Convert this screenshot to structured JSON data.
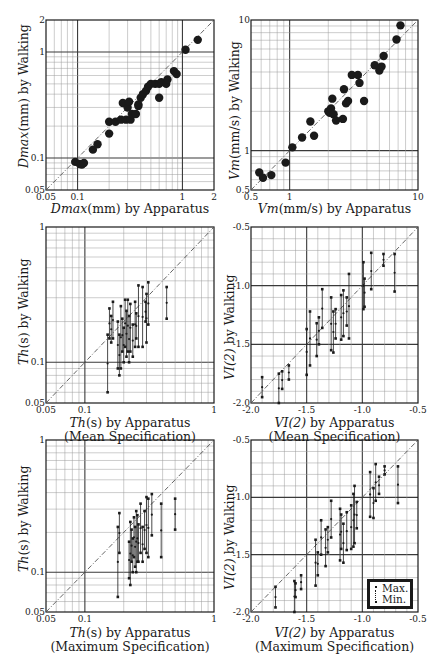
{
  "chart_data": [
    {
      "id": "p1",
      "type": "scatter",
      "scale": "log",
      "box": [
        46,
        20,
        214,
        190
      ],
      "xlim": [
        0.05,
        2
      ],
      "ylim": [
        0.05,
        2
      ],
      "xticks": [
        0.05,
        0.1,
        1,
        2
      ],
      "xtick_labels": [
        "0.05",
        "0.1",
        "1",
        "2"
      ],
      "yticks": [
        0.05,
        0.1,
        1,
        2
      ],
      "ytick_labels": [
        "0.05",
        "0.1",
        "1",
        "2"
      ],
      "major_grid": [
        0.1,
        1
      ],
      "xlabel_var": "Dmax",
      "xlabel_rest": "(mm) by Apparatus",
      "xlabel_sub": "",
      "ylabel_var": "Dmax",
      "ylabel_rest": "(mm) by Walking",
      "diagonal": true,
      "marker": "filled-circle",
      "points": [
        [
          0.095,
          0.092
        ],
        [
          0.105,
          0.088
        ],
        [
          0.11,
          0.087
        ],
        [
          0.115,
          0.09
        ],
        [
          0.14,
          0.12
        ],
        [
          0.155,
          0.135
        ],
        [
          0.2,
          0.17
        ],
        [
          0.2,
          0.22
        ],
        [
          0.23,
          0.22
        ],
        [
          0.26,
          0.23
        ],
        [
          0.27,
          0.33
        ],
        [
          0.29,
          0.23
        ],
        [
          0.3,
          0.3
        ],
        [
          0.31,
          0.34
        ],
        [
          0.32,
          0.23
        ],
        [
          0.33,
          0.26
        ],
        [
          0.36,
          0.26
        ],
        [
          0.38,
          0.31
        ],
        [
          0.38,
          0.32
        ],
        [
          0.4,
          0.37
        ],
        [
          0.42,
          0.4
        ],
        [
          0.45,
          0.43
        ],
        [
          0.47,
          0.47
        ],
        [
          0.5,
          0.5
        ],
        [
          0.55,
          0.5
        ],
        [
          0.6,
          0.37
        ],
        [
          0.6,
          0.5
        ],
        [
          0.63,
          0.52
        ],
        [
          0.7,
          0.5
        ],
        [
          0.72,
          0.55
        ],
        [
          0.83,
          0.66
        ],
        [
          0.88,
          0.62
        ],
        [
          1.07,
          1.05
        ],
        [
          1.4,
          1.3
        ]
      ]
    },
    {
      "id": "p2",
      "type": "scatter",
      "scale": "log",
      "box": [
        251,
        20,
        418,
        190
      ],
      "xlim": [
        0.5,
        10
      ],
      "ylim": [
        0.5,
        10
      ],
      "xticks": [
        0.5,
        1,
        10
      ],
      "xtick_labels": [
        "0.5",
        "1",
        "10"
      ],
      "yticks": [
        0.5,
        1,
        10
      ],
      "ytick_labels": [
        "0.5",
        "1",
        "10"
      ],
      "major_grid": [
        1
      ],
      "xlabel_var": "Vm",
      "xlabel_rest": "(mm/s) by Apparatus",
      "xlabel_sub": "",
      "ylabel_var": "Vm",
      "ylabel_rest": "(mm/s) by Walking",
      "diagonal": true,
      "marker": "filled-circle",
      "points": [
        [
          0.58,
          0.68
        ],
        [
          0.62,
          0.62
        ],
        [
          0.72,
          0.65
        ],
        [
          0.93,
          0.81
        ],
        [
          1.05,
          1.06
        ],
        [
          1.25,
          1.26
        ],
        [
          1.45,
          1.67
        ],
        [
          1.55,
          1.3
        ],
        [
          2.0,
          2.0
        ],
        [
          2.05,
          1.95
        ],
        [
          2.1,
          2.1
        ],
        [
          2.15,
          2.5
        ],
        [
          2.2,
          1.9
        ],
        [
          2.3,
          1.7
        ],
        [
          2.6,
          1.75
        ],
        [
          2.65,
          2.95
        ],
        [
          2.75,
          2.3
        ],
        [
          2.85,
          2.4
        ],
        [
          3.05,
          3.8
        ],
        [
          3.4,
          3.8
        ],
        [
          3.5,
          3.3
        ],
        [
          3.8,
          2.4
        ],
        [
          4.6,
          4.5
        ],
        [
          5.0,
          4.1
        ],
        [
          5.2,
          4.4
        ],
        [
          5.4,
          5.3
        ],
        [
          6.8,
          7.1
        ],
        [
          7.3,
          9.1
        ]
      ]
    },
    {
      "id": "p3",
      "type": "range",
      "scale": "log",
      "box": [
        46,
        227,
        214,
        403
      ],
      "xlim": [
        0.05,
        1
      ],
      "ylim": [
        0.05,
        1
      ],
      "xticks": [
        0.05,
        0.1,
        1
      ],
      "xtick_labels": [
        "0.05",
        "0.1",
        "1"
      ],
      "yticks": [
        0.05,
        0.1,
        1
      ],
      "ytick_labels": [
        "0.05",
        "0.1",
        "1"
      ],
      "major_grid": [
        0.1
      ],
      "xlabel_var": "Th",
      "xlabel_rest": "(s) by Apparatus",
      "xlabel_sub": "(Mean Specification)",
      "ylabel_var": "Th",
      "ylabel_rest": "(s) by Walking",
      "diagonal": true,
      "marker": "range-bar",
      "points": [
        [
          0.15,
          0.16,
          0.06
        ],
        [
          0.155,
          0.25,
          0.15
        ],
        [
          0.16,
          0.22,
          0.14
        ],
        [
          0.165,
          0.28,
          0.15
        ],
        [
          0.18,
          0.2,
          0.09
        ],
        [
          0.185,
          0.16,
          0.08
        ],
        [
          0.19,
          0.26,
          0.09
        ],
        [
          0.195,
          0.21,
          0.12
        ],
        [
          0.2,
          0.18,
          0.1
        ],
        [
          0.205,
          0.29,
          0.13
        ],
        [
          0.21,
          0.24,
          0.11
        ],
        [
          0.215,
          0.29,
          0.12
        ],
        [
          0.22,
          0.22,
          0.1
        ],
        [
          0.225,
          0.27,
          0.12
        ],
        [
          0.235,
          0.19,
          0.11
        ],
        [
          0.245,
          0.28,
          0.13
        ],
        [
          0.25,
          0.23,
          0.15
        ],
        [
          0.26,
          0.37,
          0.13
        ],
        [
          0.28,
          0.36,
          0.13
        ],
        [
          0.295,
          0.28,
          0.2
        ],
        [
          0.3,
          0.32,
          0.14
        ],
        [
          0.31,
          0.39,
          0.19
        ],
        [
          0.43,
          0.36,
          0.21
        ]
      ]
    },
    {
      "id": "p4",
      "type": "range",
      "scale": "linear",
      "box": [
        251,
        227,
        418,
        403
      ],
      "xlim": [
        -2.0,
        -0.5
      ],
      "ylim": [
        -2.0,
        -0.5
      ],
      "xticks": [
        -2.0,
        -1.5,
        -1.0,
        -0.5
      ],
      "xtick_labels": [
        "-2.0",
        "-1.5",
        "-1.0",
        "-0.5"
      ],
      "yticks": [
        -2.0,
        -1.5,
        -1.0,
        -0.5
      ],
      "ytick_labels": [
        "-2.0",
        "-1.5",
        "-1.0",
        "-0.5"
      ],
      "major_grid": [
        -1.5,
        -1.0
      ],
      "minor_step": 0.1,
      "xlabel_var": "VI(2)",
      "xlabel_rest": " by Apparatus",
      "xlabel_sub": "(Mean Specification)",
      "ylabel_var": "VI(2)",
      "ylabel_rest": " by Walking",
      "diagonal": true,
      "marker": "range-bar",
      "points": [
        [
          -1.9,
          -1.78,
          -1.95
        ],
        [
          -1.75,
          -1.75,
          -2.0
        ],
        [
          -1.72,
          -1.73,
          -1.88
        ],
        [
          -1.66,
          -1.68,
          -1.8
        ],
        [
          -1.5,
          -1.37,
          -1.76
        ],
        [
          -1.47,
          -1.22,
          -1.68
        ],
        [
          -1.41,
          -1.32,
          -1.6
        ],
        [
          -1.39,
          -1.27,
          -1.5
        ],
        [
          -1.36,
          -1.03,
          -1.36
        ],
        [
          -1.28,
          -1.1,
          -1.55
        ],
        [
          -1.26,
          -1.22,
          -1.57
        ],
        [
          -1.24,
          -1.2,
          -1.45
        ],
        [
          -1.19,
          -1.08,
          -1.46
        ],
        [
          -1.17,
          -1.04,
          -1.43
        ],
        [
          -1.14,
          -1.1,
          -1.34
        ],
        [
          -1.12,
          -0.9,
          -1.45
        ],
        [
          -0.99,
          -0.8,
          -1.2
        ],
        [
          -0.98,
          -0.94,
          -1.18
        ],
        [
          -0.92,
          -0.72,
          -1.03
        ],
        [
          -0.81,
          -0.73,
          -0.83
        ],
        [
          -0.71,
          -0.73,
          -1.05
        ]
      ]
    },
    {
      "id": "p5",
      "type": "range",
      "scale": "log",
      "box": [
        46,
        440,
        214,
        612
      ],
      "xlim": [
        0.05,
        1
      ],
      "ylim": [
        0.05,
        1
      ],
      "xticks": [
        0.05,
        0.1,
        1
      ],
      "xtick_labels": [
        "0.05",
        "0.1",
        "1"
      ],
      "yticks": [
        0.05,
        0.1,
        1
      ],
      "ytick_labels": [
        "0.05",
        "0.1",
        "1"
      ],
      "major_grid": [
        0.1
      ],
      "xlabel_var": "Th",
      "xlabel_rest": "(s) by Apparatus",
      "xlabel_sub": "(Maximum Specification)",
      "ylabel_var": "Th",
      "ylabel_rest": "(s) by Walking",
      "diagonal": true,
      "marker": "range-bar",
      "points": [
        [
          0.18,
          0.22,
          0.065
        ],
        [
          0.185,
          0.28,
          0.14
        ],
        [
          0.22,
          0.17,
          0.09
        ],
        [
          0.225,
          0.24,
          0.08
        ],
        [
          0.23,
          0.21,
          0.12
        ],
        [
          0.235,
          0.18,
          0.1
        ],
        [
          0.24,
          0.26,
          0.13
        ],
        [
          0.245,
          0.22,
          0.11
        ],
        [
          0.25,
          0.29,
          0.1
        ],
        [
          0.255,
          0.27,
          0.12
        ],
        [
          0.26,
          0.23,
          0.12
        ],
        [
          0.27,
          0.33,
          0.14
        ],
        [
          0.28,
          0.22,
          0.12
        ],
        [
          0.29,
          0.29,
          0.15
        ],
        [
          0.3,
          0.37,
          0.14
        ],
        [
          0.31,
          0.36,
          0.13
        ],
        [
          0.33,
          0.39,
          0.19
        ],
        [
          0.39,
          0.33,
          0.13
        ],
        [
          0.5,
          0.36,
          0.21
        ]
      ]
    },
    {
      "id": "p6",
      "type": "range",
      "scale": "linear",
      "box": [
        251,
        440,
        418,
        612
      ],
      "xlim": [
        -2.0,
        -0.5
      ],
      "ylim": [
        -2.0,
        -0.5
      ],
      "xticks": [
        -2.0,
        -1.5,
        -1.0,
        -0.5
      ],
      "xtick_labels": [
        "-2.0",
        "-1.5",
        "-1.0",
        "-0.5"
      ],
      "yticks": [
        -2.0,
        -1.5,
        -1.0,
        -0.5
      ],
      "ytick_labels": [
        "-2.0",
        "-1.5",
        "-1.0",
        "-0.5"
      ],
      "major_grid": [
        -1.5,
        -1.0
      ],
      "minor_step": 0.1,
      "xlabel_var": "VI(2)",
      "xlabel_rest": " by Apparatus",
      "xlabel_sub": "(Maximum Specification)",
      "ylabel_var": "VI(2)",
      "ylabel_rest": " by Walking",
      "diagonal": true,
      "marker": "range-bar",
      "legend": {
        "max_label": "Max.",
        "min_label": "Min."
      },
      "points": [
        [
          -1.78,
          -1.78,
          -1.96
        ],
        [
          -1.61,
          -1.73,
          -2.0
        ],
        [
          -1.6,
          -1.75,
          -1.87
        ],
        [
          -1.55,
          -1.68,
          -1.8
        ],
        [
          -1.42,
          -1.37,
          -1.77
        ],
        [
          -1.4,
          -1.48,
          -1.68
        ],
        [
          -1.37,
          -1.2,
          -1.5
        ],
        [
          -1.33,
          -1.28,
          -1.6
        ],
        [
          -1.31,
          -1.26,
          -1.48
        ],
        [
          -1.28,
          -1.03,
          -1.35
        ],
        [
          -1.2,
          -1.1,
          -1.55
        ],
        [
          -1.19,
          -1.15,
          -1.45
        ],
        [
          -1.17,
          -1.23,
          -1.57
        ],
        [
          -1.14,
          -1.13,
          -1.46
        ],
        [
          -1.1,
          -1.07,
          -1.45
        ],
        [
          -1.08,
          -0.97,
          -1.43
        ],
        [
          -1.07,
          -0.9,
          -1.4
        ],
        [
          -1.05,
          -1.04,
          -1.27
        ],
        [
          -0.93,
          -0.78,
          -1.17
        ],
        [
          -0.9,
          -0.92,
          -1.18
        ],
        [
          -0.88,
          -0.71,
          -1.03
        ],
        [
          -0.85,
          -0.82,
          -0.97
        ],
        [
          -0.8,
          -0.73,
          -0.8
        ],
        [
          -0.68,
          -0.73,
          -1.05
        ]
      ]
    }
  ],
  "labels": {
    "p1": {
      "x_var": "Dmax",
      "x_rest": "(mm) by Apparatus",
      "x_sub": "",
      "y_var": "Dmax",
      "y_rest": "(mm) by Walking"
    },
    "p2": {
      "x_var": "Vm",
      "x_rest": "(mm/s) by Apparatus",
      "x_sub": "",
      "y_var": "Vm",
      "y_rest": "(mm/s) by Walking"
    },
    "p3": {
      "x_var": "Th",
      "x_rest": "(s) by Apparatus",
      "x_sub": "(Mean Specification)",
      "y_var": "Th",
      "y_rest": "(s) by Walking"
    },
    "p4": {
      "x_var": "VI(2)",
      "x_rest": " by Apparatus",
      "x_sub": "(Mean Specification)",
      "y_var": "VI(2)",
      "y_rest": " by Walking"
    },
    "p5": {
      "x_var": "Th",
      "x_rest": "(s) by Apparatus",
      "x_sub": "(Maximum Specification)",
      "y_var": "Th",
      "y_rest": "(s) by Walking"
    },
    "p6": {
      "x_var": "VI(2)",
      "x_rest": " by Apparatus",
      "x_sub": "(Maximum Specification)",
      "y_var": "VI(2)",
      "y_rest": " by Walking"
    }
  },
  "legend": {
    "max_label": "Max.",
    "min_label": "Min."
  },
  "colors": {
    "ink": "#1a1a1a",
    "grid": "#9a9a9a",
    "major_grid": "#3a3a3a",
    "diagonal": "#555555",
    "background": "#ffffff"
  }
}
